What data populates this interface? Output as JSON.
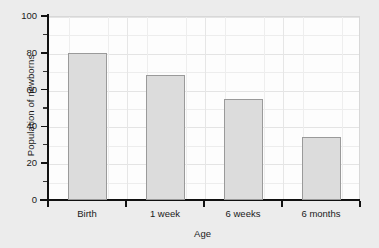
{
  "chart_data": {
    "type": "bar",
    "title": "",
    "xlabel": "Age",
    "ylabel": "Population of newborns",
    "categories": [
      "Birth",
      "1 week",
      "6 weeks",
      "6 months"
    ],
    "values": [
      80,
      68,
      55,
      34
    ],
    "ylim": [
      0,
      100
    ],
    "ytick_labels": [
      "0",
      "20",
      "40",
      "60",
      "80",
      "100"
    ],
    "ytick_values": [
      0,
      20,
      40,
      60,
      80,
      100
    ],
    "yminor_values": [
      10,
      30,
      50,
      70,
      90
    ],
    "grid": true,
    "legend": "none",
    "bar_fill": "#dcdcdc",
    "bar_edge": "#9a9a9a",
    "plot_background": "#fdfdfd",
    "figure_background": "#ececec",
    "axis_color": "#111111"
  }
}
